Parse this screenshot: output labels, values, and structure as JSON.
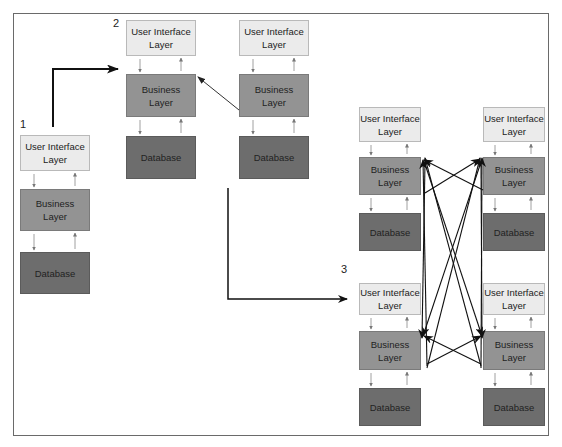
{
  "diagram": {
    "stages": [
      {
        "label": "1",
        "stacks": [
          {
            "id": "s1",
            "layers": [
              "User Interface Layer",
              "Business Layer",
              "Database"
            ]
          }
        ]
      },
      {
        "label": "2",
        "stacks": [
          {
            "id": "s2a",
            "layers": [
              "User Interface Layer",
              "Business Layer",
              "Database"
            ]
          },
          {
            "id": "s2b",
            "layers": [
              "User Interface Layer",
              "Business Layer",
              "Database"
            ]
          }
        ]
      },
      {
        "label": "3",
        "stacks": [
          {
            "id": "s3a",
            "layers": [
              "User Interface Layer",
              "Business Layer",
              "Database"
            ]
          },
          {
            "id": "s3b",
            "layers": [
              "User Interface Layer",
              "Business Layer",
              "Database"
            ]
          },
          {
            "id": "s3c",
            "layers": [
              "User Interface Layer",
              "Business Layer",
              "Database"
            ]
          },
          {
            "id": "s3d",
            "layers": [
              "User Interface Layer",
              "Business Layer",
              "Database"
            ]
          }
        ]
      }
    ],
    "layer_text": {
      "ui": "User Interface Layer",
      "ui_line1": "User Interface",
      "ui_line2": "Layer",
      "bl_line1": "Business",
      "bl_line2": "Layer",
      "db": "Database"
    },
    "colors": {
      "ui": "#ebebeb",
      "business": "#939393",
      "database": "#6d6d6d",
      "arrow": "#111111",
      "small_arrow": "#777777"
    },
    "connections": [
      {
        "from": "stage-1",
        "to": "stage-2",
        "type": "progression"
      },
      {
        "from": "s2b.business",
        "to": "s2a.business",
        "type": "communication"
      },
      {
        "from": "stage-2",
        "to": "stage-3",
        "type": "progression"
      },
      {
        "from": "s3b.business",
        "to": "s3a.business",
        "type": "communication"
      },
      {
        "from": "s3a.business",
        "to": "s3b.business",
        "type": "communication"
      },
      {
        "from": "s3c.business",
        "to": "s3a.business",
        "type": "communication"
      },
      {
        "from": "s3d.business",
        "to": "s3a.business",
        "type": "communication"
      },
      {
        "from": "s3c.business",
        "to": "s3b.business",
        "type": "communication"
      },
      {
        "from": "s3d.business",
        "to": "s3b.business",
        "type": "communication"
      },
      {
        "from": "s3a.business",
        "to": "s3c.business",
        "type": "communication"
      },
      {
        "from": "s3b.business",
        "to": "s3c.business",
        "type": "communication"
      },
      {
        "from": "s3a.business",
        "to": "s3d.business",
        "type": "communication"
      },
      {
        "from": "s3b.business",
        "to": "s3d.business",
        "type": "communication"
      },
      {
        "from": "s3d.business",
        "to": "s3c.business",
        "type": "communication"
      },
      {
        "from": "s3c.business",
        "to": "s3d.business",
        "type": "communication"
      }
    ]
  }
}
